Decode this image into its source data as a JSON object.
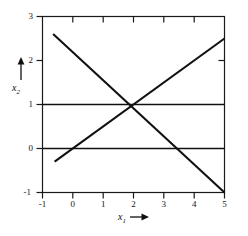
{
  "figure": {
    "name": "two-variable-line-plot",
    "background_color": "#ffffff",
    "line_color": "#111111",
    "axis_color": "#1a1a1a"
  },
  "axes": {
    "x": {
      "title_base": "x",
      "title_sub": "1",
      "arrow": "right-arrow",
      "min": -1,
      "max": 5,
      "ticks": [
        -1,
        0,
        1,
        2,
        3,
        4,
        5
      ],
      "tick_labels": [
        "-1",
        "0",
        "1",
        "2",
        "3",
        "4",
        "5"
      ]
    },
    "y": {
      "title_base": "x",
      "title_sub": "2",
      "arrow": "up-arrow",
      "min": -1,
      "max": 3,
      "ticks": [
        -1,
        0,
        1,
        2,
        3
      ],
      "tick_labels": [
        "-1",
        "0",
        "1",
        "2",
        "3"
      ]
    }
  },
  "chart_data": {
    "type": "line",
    "title": "",
    "subtitle": "",
    "xlabel": "x1",
    "ylabel": "x2",
    "xlim": [
      -1,
      5
    ],
    "ylim": [
      -1,
      3
    ],
    "xticks": [
      -1,
      0,
      1,
      2,
      3,
      4,
      5
    ],
    "yticks": [
      -1,
      0,
      1,
      2,
      3
    ],
    "grid": false,
    "legend": "none",
    "frame": "box",
    "series": [
      {
        "name": "x2 = 1",
        "kind": "horizontal-line",
        "slope": 0,
        "intercept": 1,
        "x": [
          -1,
          5
        ],
        "values": [
          1,
          1
        ]
      },
      {
        "name": "x2 = 0",
        "kind": "horizontal-line",
        "slope": 0,
        "intercept": 0,
        "x": [
          -1,
          5
        ],
        "values": [
          0,
          0
        ]
      },
      {
        "name": "descending-line",
        "kind": "segment",
        "slope": -0.6667,
        "intercept": 2.3333,
        "x": [
          -0.65,
          5
        ],
        "values": [
          2.6,
          -1
        ]
      },
      {
        "name": "ascending-line",
        "kind": "segment",
        "slope": 0.5,
        "intercept": 0,
        "x": [
          -0.6,
          5
        ],
        "values": [
          -0.3,
          2.5
        ]
      }
    ],
    "annotations": [
      {
        "name": "common-intersection",
        "x": 2,
        "y": 1,
        "label": ""
      }
    ]
  }
}
